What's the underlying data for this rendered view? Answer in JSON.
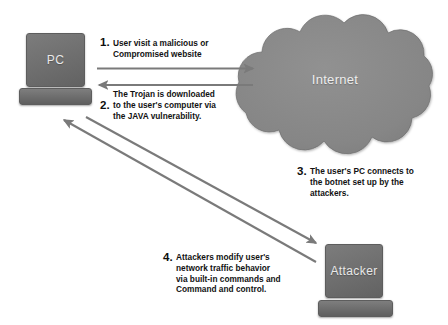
{
  "diagram": {
    "background_color": "#ffffff",
    "node_fill_color": "#6f6f6f",
    "cloud_fill_color": "#868686",
    "arrow_color": "#7a7a7a",
    "text_color": "#121212"
  },
  "nodes": {
    "pc": {
      "label": "PC",
      "icon": "computer-monitor-icon"
    },
    "internet": {
      "label": "Internet",
      "icon": "cloud-icon"
    },
    "attacker": {
      "label": "Attacker",
      "icon": "computer-monitor-icon"
    }
  },
  "steps": [
    {
      "number": "1.",
      "text": "User visit a malicious or\nCompromised website",
      "arrow": "pc-to-internet"
    },
    {
      "number": "2.",
      "text": "The Trojan is downloaded\nto the user's computer via\nthe JAVA vulnerability.",
      "arrow": "internet-to-pc"
    },
    {
      "number": "3.",
      "text": "The user's PC connects to\nthe botnet set up by the\nattackers.",
      "arrow": "pc-to-attacker"
    },
    {
      "number": "4.",
      "text": "Attackers modify user's\nnetwork traffic behavior\nvia built-in commands and\nCommand and control.",
      "arrow": "attacker-to-pc"
    }
  ]
}
